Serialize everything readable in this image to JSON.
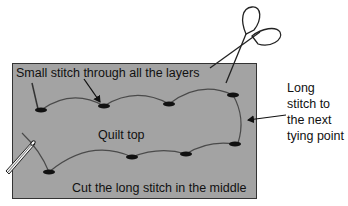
{
  "diagram": {
    "type": "quilting-tying-stitch-diagram",
    "colors": {
      "background": "#ffffff",
      "quilt_fill": "#a3a3a3",
      "quilt_border": "#333333",
      "thread": "#4a4a4a",
      "stitch": "#111111",
      "text": "#111111"
    },
    "labels": {
      "small_stitch": "Small stitch through all the layers",
      "quilt_top": "Quilt top",
      "cut_instruction": "Cut the long stitch in the middle",
      "long_stitch_lines": [
        "Long",
        "stitch to",
        "the next",
        "tying point"
      ]
    },
    "icons": {
      "scissors": "scissors-icon",
      "needle": "needle-icon"
    },
    "stitch_points": {
      "top_row": [
        [
          41,
          110
        ],
        [
          104,
          106
        ],
        [
          169,
          104
        ],
        [
          233,
          95
        ]
      ],
      "bottom_row": [
        [
          49,
          172
        ],
        [
          132,
          157
        ],
        [
          186,
          154
        ],
        [
          235,
          144
        ]
      ]
    }
  }
}
